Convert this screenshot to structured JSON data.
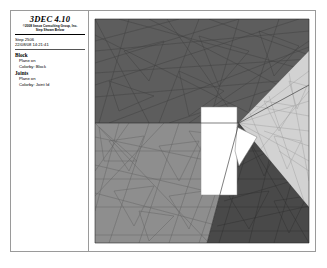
{
  "window": {
    "name": "3dec-plot-window"
  },
  "legend": {
    "title": "3DEC 4.10",
    "subtitle_line1": "©2008 Itasca Consulting Group, Inc.",
    "subtitle_line2": "Step Shown Below",
    "step_label": "Step 2506",
    "timestamp": "22/08/08 14:21:41",
    "groups": [
      {
        "heading": "Block",
        "items": [
          "Plane  on",
          "Colorby: Block"
        ]
      },
      {
        "heading": "Joints",
        "items": [
          "Plane  on",
          "Colorby: Joint Id"
        ]
      }
    ]
  },
  "viewport": {
    "name": "model-viewport",
    "background": "#ffffff",
    "model": {
      "type": "3d-block-model",
      "description": "Shaded 3D discrete-element block model with triangular mesh edges and a rectangular excavation opening",
      "faces": [
        {
          "name": "top-face",
          "fill": "#5d5d5d",
          "edge": "#3a3a3a"
        },
        {
          "name": "front-left-face",
          "fill": "#8e8e8e",
          "edge": "#5a5a5a"
        },
        {
          "name": "front-right-face",
          "fill": "#4a4a4a",
          "edge": "#2e2e2e"
        },
        {
          "name": "right-face",
          "fill": "#d2d2d2",
          "edge": "#9b9b9b"
        },
        {
          "name": "excavation-opening",
          "fill": "#ffffff",
          "edge": "#8a8a8a"
        },
        {
          "name": "excavation-wedge",
          "fill": "#ffffff",
          "edge": "#777777"
        }
      ]
    }
  }
}
